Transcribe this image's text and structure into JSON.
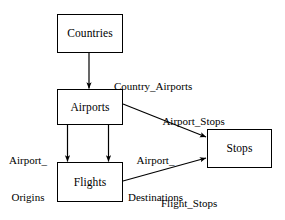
{
  "diagram": {
    "type": "entity-relationship-diagram",
    "stroke_color": "#000000",
    "fill_color": "#ffffff",
    "text_color": "#000000",
    "entities": [
      {
        "id": "countries",
        "label": "Countries",
        "x": 57,
        "y": 14,
        "width": 66,
        "height": 39
      },
      {
        "id": "airports",
        "label": "Airports",
        "x": 57,
        "y": 89,
        "width": 66,
        "height": 36
      },
      {
        "id": "flights",
        "label": "Flights",
        "x": 57,
        "y": 162,
        "width": 66,
        "height": 40
      },
      {
        "id": "stops",
        "label": "Stops",
        "x": 207,
        "y": 129,
        "width": 65,
        "height": 39
      }
    ],
    "relationships": [
      {
        "id": "country-airports",
        "label": "Country_Airports",
        "from": "countries",
        "to": "airports",
        "label_x": 103,
        "label_y": 68,
        "lines": [
          "Country_Airports"
        ]
      },
      {
        "id": "airport-origins",
        "label": "Airport_Origins",
        "from": "airports",
        "to": "flights",
        "label_x": 9,
        "label_y": 129,
        "lines": [
          "Airport_",
          "Origins"
        ]
      },
      {
        "id": "airport-destinations",
        "label": "Airport_Destinations",
        "from": "airports",
        "to": "flights",
        "label_x": 128,
        "label_y": 129,
        "lines": [
          "Airport_",
          "Destinations"
        ]
      },
      {
        "id": "airport-stops",
        "label": "Airport_Stops",
        "from": "airports",
        "to": "stops",
        "label_x": 152,
        "label_y": 103,
        "lines": [
          "Airport_Stops"
        ]
      },
      {
        "id": "flight-stops",
        "label": "Flight_Stops",
        "from": "flights",
        "to": "stops",
        "label_x": 150,
        "label_y": 185,
        "lines": [
          "Flight_Stops"
        ]
      }
    ]
  }
}
